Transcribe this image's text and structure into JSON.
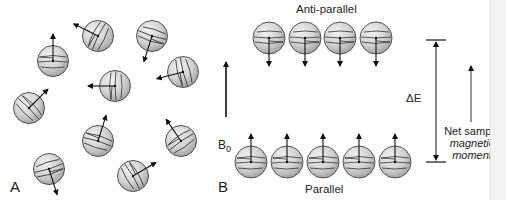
{
  "figure": {
    "panel_a": {
      "label": "A",
      "spheres": [
        {
          "cx": 53,
          "cy": 61,
          "dir": [
            0,
            -1
          ]
        },
        {
          "cx": 98,
          "cy": 36,
          "dir": [
            -0.9,
            -0.45
          ]
        },
        {
          "cx": 152,
          "cy": 36,
          "dir": [
            -0.3,
            0.95
          ]
        },
        {
          "cx": 183,
          "cy": 72,
          "dir": [
            -0.97,
            0.25
          ]
        },
        {
          "cx": 115,
          "cy": 86,
          "dir": [
            -1,
            0
          ]
        },
        {
          "cx": 29,
          "cy": 108,
          "dir": [
            0.7,
            -0.7
          ]
        },
        {
          "cx": 98,
          "cy": 141,
          "dir": [
            0.3,
            -0.95
          ]
        },
        {
          "cx": 181,
          "cy": 141,
          "dir": [
            -0.55,
            -0.8
          ]
        },
        {
          "cx": 49,
          "cy": 169,
          "dir": [
            0.3,
            0.95
          ]
        },
        {
          "cx": 133,
          "cy": 176,
          "dir": [
            0.85,
            -0.5
          ]
        }
      ]
    },
    "panel_b": {
      "label": "B",
      "field_label": "B",
      "field_subscript": "0",
      "anti_parallel": {
        "title": "Anti-parallel",
        "spheres": [
          {
            "cx": 269,
            "cy": 38
          },
          {
            "cx": 305,
            "cy": 38
          },
          {
            "cx": 340,
            "cy": 38
          },
          {
            "cx": 376,
            "cy": 38
          }
        ]
      },
      "parallel": {
        "title": "Parallel",
        "spheres": [
          {
            "cx": 251,
            "cy": 162
          },
          {
            "cx": 287,
            "cy": 162
          },
          {
            "cx": 323,
            "cy": 162
          },
          {
            "cx": 359,
            "cy": 162
          },
          {
            "cx": 395,
            "cy": 162
          }
        ]
      },
      "energy_gap_label": "ΔE",
      "net_moment": {
        "line1": "Net sample",
        "line2": "magnetic",
        "line3": "moment"
      }
    }
  }
}
